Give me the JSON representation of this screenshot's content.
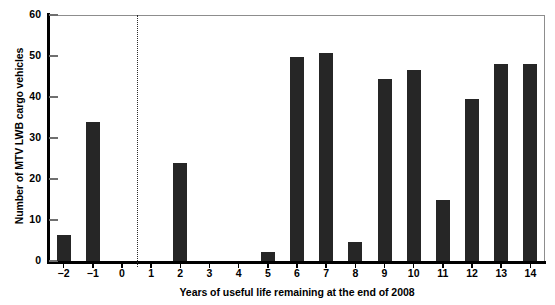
{
  "chart_data": {
    "type": "bar",
    "title": "",
    "xlabel": "Years of useful life remaining at the end of 2008",
    "ylabel": "Number of MTV LWB cargo vehicles",
    "categories": [
      "−2",
      "−1",
      "0",
      "1",
      "2",
      "3",
      "4",
      "5",
      "6",
      "7",
      "8",
      "9",
      "10",
      "11",
      "12",
      "13",
      "14"
    ],
    "values": [
      6.3,
      34.0,
      0,
      0,
      23.9,
      0,
      0,
      2.2,
      49.8,
      50.7,
      4.7,
      44.5,
      46.5,
      14.8,
      39.6,
      48.1,
      48.1
    ],
    "ylim": [
      0,
      60
    ],
    "yticks": [
      0,
      10,
      20,
      30,
      40,
      50,
      60
    ],
    "ytick_labels": [
      "0",
      "10",
      "20",
      "30",
      "40",
      "50",
      "60"
    ],
    "grid": false,
    "legend": "none",
    "bar_color": "#262626",
    "annotations": [
      {
        "name": "reference-line",
        "type": "vertical-dashed-line",
        "x_between": [
          "0",
          "1"
        ],
        "style": "dotted",
        "color": "#2b2b2b"
      }
    ]
  }
}
